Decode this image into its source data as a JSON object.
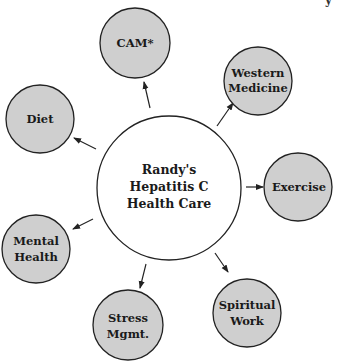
{
  "diagram": {
    "type": "hub-and-spoke",
    "center": {
      "label_lines": [
        "Randy's",
        "Hepatitis C",
        "Health Care"
      ],
      "fill": "#ffffff"
    },
    "satellites": [
      {
        "id": "cam",
        "label_lines": [
          "CAM*"
        ]
      },
      {
        "id": "western-medicine",
        "label_lines": [
          "Western",
          "Medicine"
        ]
      },
      {
        "id": "exercise",
        "label_lines": [
          "Exercise"
        ]
      },
      {
        "id": "spiritual-work",
        "label_lines": [
          "Spiritual",
          "Work"
        ]
      },
      {
        "id": "stress-mgmt",
        "label_lines": [
          "Stress",
          "Mgmt."
        ]
      },
      {
        "id": "mental-health",
        "label_lines": [
          "Mental",
          "Health"
        ]
      },
      {
        "id": "diet",
        "label_lines": [
          "Diet"
        ]
      }
    ],
    "arrow_direction": "center-to-satellite",
    "colors": {
      "satellite_fill": "#cfcfcf",
      "stroke": "#222222",
      "text": "#1a1a1a",
      "background": "#ffffff"
    },
    "corner_fragment": "y"
  }
}
